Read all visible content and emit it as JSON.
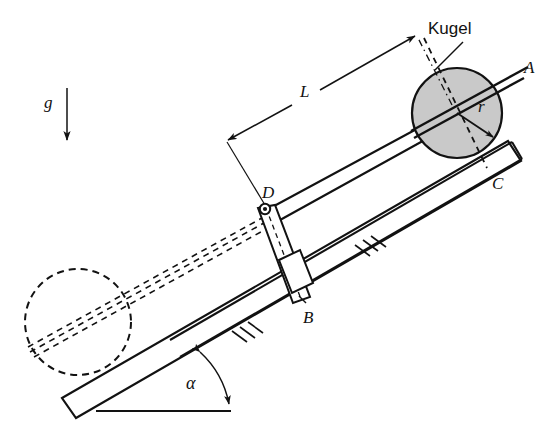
{
  "figure": {
    "type": "mechanism-diagram",
    "language": "de",
    "background_color": "#ffffff",
    "line_color": "#121212",
    "ball_fill_color": "#c9c9c9",
    "ball_stroke_color": "#121212"
  },
  "labels": {
    "gravity": "g",
    "length": "L",
    "radius": "r",
    "ball": "Kugel",
    "point_a": "A",
    "point_b": "B",
    "point_c": "C",
    "point_d": "D",
    "angle": "α"
  },
  "annotations": {
    "gravity_arrow": "downward arrow indicating gravity direction",
    "length_dimension": "double-headed dimension line labelled L from D to ball center",
    "radius_arrow": "arrow from ball center to ball surface labelled r",
    "angle_arc": "double-headed arc between ground line and inclined plane labelled alpha",
    "ghost_circle": "dashed phantom circle showing alternate ball position",
    "hatching_upper": "ground hatching marks on lower rail",
    "hatching_lower": "ground hatching marks on inclined plane",
    "pivot_d": "revolute joint at point D",
    "slider_b": "slider block at point B"
  },
  "geometry": {
    "ball_center": {
      "x": 457,
      "y": 113
    },
    "ball_radius": 45,
    "ghost_circle_center": {
      "x": 78,
      "y": 322
    },
    "ghost_circle_radius": 53,
    "point_d": {
      "x": 264,
      "y": 212
    },
    "point_b": {
      "x": 300,
      "y": 302
    },
    "ground_line_y": 411,
    "angle_alpha_degrees": 22
  }
}
